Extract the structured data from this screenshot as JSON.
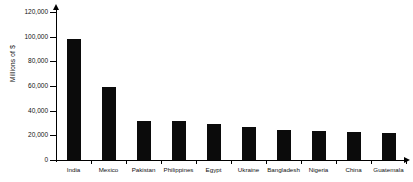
{
  "chart_data": {
    "type": "bar",
    "title": "",
    "xlabel": "",
    "ylabel": "Millions of $",
    "categories": [
      "India",
      "Mexico",
      "Pakistan",
      "Philippines",
      "Egypt",
      "Ukraine",
      "Bangladesh",
      "Nigeria",
      "China",
      "Guatemala"
    ],
    "values": [
      98000,
      59000,
      32000,
      32000,
      29000,
      27000,
      24000,
      23500,
      22500,
      21500
    ],
    "ylim": [
      0,
      120000
    ],
    "yticks": [
      0,
      20000,
      40000,
      60000,
      80000,
      100000,
      120000
    ],
    "ytick_labels": [
      "0",
      "20,000",
      "40,000",
      "60,000",
      "80,000",
      "100,000",
      "120,000"
    ],
    "grid": false,
    "legend": "none",
    "bar_color": "#0b0b0b",
    "axis_color": "#000000"
  }
}
